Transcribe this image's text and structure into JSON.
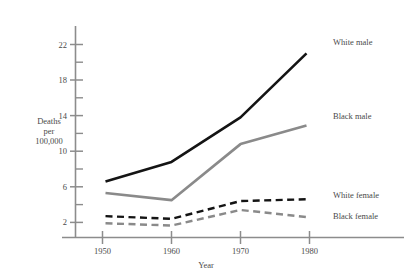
{
  "chart_data": {
    "type": "line",
    "title": "",
    "xlabel": "Year",
    "ylabel_lines": [
      "Deaths",
      "per",
      "100,000"
    ],
    "x": [
      1950,
      1960,
      1970,
      1980
    ],
    "xtick_labels": [
      "1950",
      "1960",
      "1970",
      "1980"
    ],
    "ytick_labels": [
      "2",
      "6",
      "10",
      "14",
      "18",
      "22"
    ],
    "ytick_values": [
      2,
      6,
      10,
      14,
      18,
      22
    ],
    "yminor_values": [
      4,
      8,
      12,
      16,
      20
    ],
    "ylim": [
      0.6,
      23.5
    ],
    "xlim": [
      1946,
      1984
    ],
    "grid": false,
    "legend_position": "right-inline",
    "series": [
      {
        "name": "White male",
        "values": [
          6.6,
          8.8,
          13.8,
          21.0
        ],
        "color": "#141414",
        "style": "solid",
        "width": 2.6
      },
      {
        "name": "Black male",
        "values": [
          5.3,
          4.5,
          10.8,
          12.9
        ],
        "color": "#8a8a8a",
        "style": "solid",
        "width": 2.6
      },
      {
        "name": "White female",
        "values": [
          2.7,
          2.4,
          4.4,
          4.6
        ],
        "color": "#141414",
        "style": "dashed",
        "width": 2.4
      },
      {
        "name": "Black female",
        "values": [
          1.9,
          1.65,
          3.4,
          2.6
        ],
        "color": "#8a8a8a",
        "style": "dashed",
        "width": 2.4
      }
    ]
  },
  "axes": {
    "x_title": "Year",
    "y_title_line1": "Deaths",
    "y_title_line2": "per",
    "y_title_line3": "100,000",
    "axis_color": "#8c8c8c"
  },
  "xticks": {
    "t0": "1950",
    "t1": "1960",
    "t2": "1970",
    "t3": "1980"
  },
  "yticks": {
    "t2": "2",
    "t6": "6",
    "t10": "10",
    "t14": "14",
    "t18": "18",
    "t22": "22"
  },
  "legend": {
    "white_male": "White male",
    "black_male": "Black male",
    "white_female": "White female",
    "black_female": "Black female"
  }
}
